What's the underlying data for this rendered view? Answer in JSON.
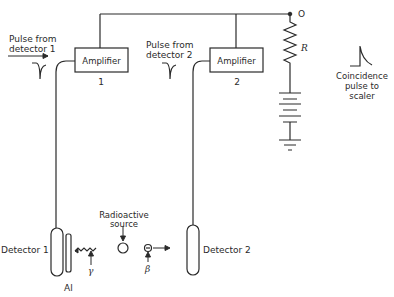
{
  "labels": {
    "pulse1_line1": "Pulse from",
    "pulse1_line2": "detector 1",
    "pulse2_line1": "Pulse from",
    "pulse2_line2": "detector 2",
    "amp1": "Amplifier",
    "amp1_num": "1",
    "amp2": "Amplifier",
    "amp2_num": "2",
    "resistor": "R",
    "output_terminal": "O",
    "coinc_line1": "Coincidence",
    "coinc_line2": "pulse to",
    "coinc_line3": "scaler",
    "det1": "Detector 1",
    "det2": "Detector 2",
    "al": "Al",
    "source_line1": "Radioactive",
    "source_line2": "source",
    "gamma": "γ",
    "beta": "β"
  },
  "colors": {
    "line": "#2a2a2a",
    "background": "#ffffff"
  }
}
